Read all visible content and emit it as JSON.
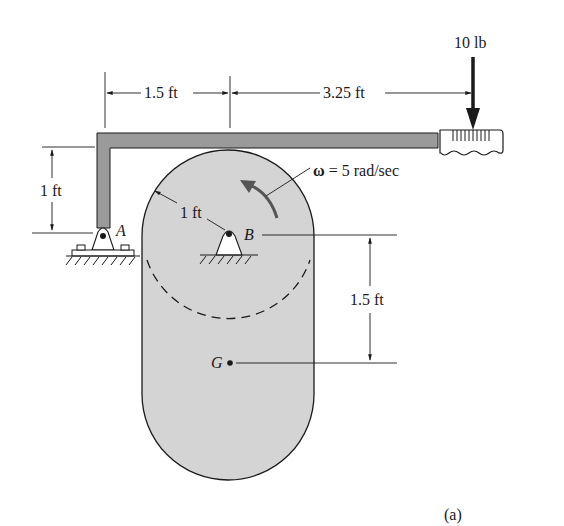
{
  "figure": {
    "caption": "(a)",
    "colors": {
      "body_fill": "#d4d4d4",
      "bar_fill": "#9a9a9a",
      "line": "#1a1a1a",
      "background": "#ffffff"
    }
  },
  "labels": {
    "dim_top_left": "1.5 ft",
    "dim_top_right": "3.25 ft",
    "force": "10 lb",
    "dim_left_vertical": "1 ft",
    "radius": "1 ft",
    "omega_symbol": "ω",
    "omega_value": " = 5 rad/sec",
    "pin_a": "A",
    "pin_b": "B",
    "dim_right_vertical": "1.5 ft",
    "center_of_mass": "G"
  },
  "quantities": {
    "horizontal_offset_A_to_B_ft": 1.5,
    "lever_arm_B_to_force_ft": 3.25,
    "applied_force_lb": 10,
    "height_of_bar_above_A_ft": 1,
    "lobe_radius_ft": 1,
    "angular_velocity_rad_per_sec": 5,
    "distance_B_to_G_ft": 1.5
  }
}
